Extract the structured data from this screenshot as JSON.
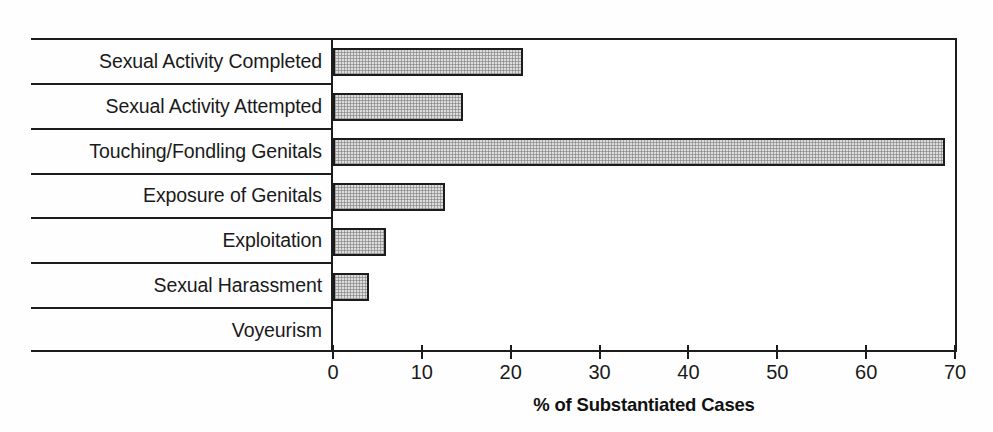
{
  "chart_data": {
    "type": "bar",
    "orientation": "horizontal",
    "title": "",
    "subtitle": "",
    "xlabel": "% of Substantiated Cases",
    "ylabel": "",
    "xlim": [
      0,
      70
    ],
    "xticks": [
      0,
      10,
      20,
      30,
      40,
      50,
      60,
      70
    ],
    "xtick_labels": [
      "0",
      "10",
      "20",
      "30",
      "40",
      "50",
      "60",
      "70"
    ],
    "grid": false,
    "legend": null,
    "categories": [
      "Sexual Activity Completed",
      "Sexual Activity Attempted",
      "Touching/Fondling Genitals",
      "Exposure of Genitals",
      "Exploitation",
      "Sexual Harassment",
      "Voyeurism"
    ],
    "values": [
      21.4,
      14.6,
      68.9,
      12.6,
      6.0,
      4.1,
      0
    ],
    "series": [
      {
        "name": "% of Substantiated Cases",
        "values": [
          21.4,
          14.6,
          68.9,
          12.6,
          6.0,
          4.1,
          0
        ]
      }
    ],
    "bar_fill_color": "#dcdcdc",
    "bar_edge_color": "#1c1c1c",
    "axis_color": "#1c1c1c",
    "background_color": "#ffffff"
  }
}
